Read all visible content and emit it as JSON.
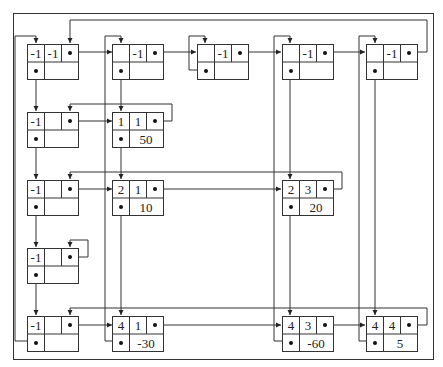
{
  "diagram": {
    "type": "orthogonal-linked-list-sparse-matrix",
    "frame_color": "#333333",
    "column_headers": [
      {
        "id": "h0",
        "row": "-1",
        "col": "-1"
      },
      {
        "id": "c1",
        "row": "",
        "col": "-1"
      },
      {
        "id": "c2",
        "row": "",
        "col": "-1"
      },
      {
        "id": "c3",
        "row": "",
        "col": "-1"
      },
      {
        "id": "c4",
        "row": "",
        "col": "-1"
      }
    ],
    "row_headers": [
      {
        "id": "r1",
        "row": "-1",
        "col": ""
      },
      {
        "id": "r2",
        "row": "-1",
        "col": ""
      },
      {
        "id": "r3",
        "row": "-1",
        "col": ""
      },
      {
        "id": "r4",
        "row": "-1",
        "col": ""
      }
    ],
    "nodes": [
      {
        "id": "n11",
        "row": "1",
        "col": "1",
        "value": "50"
      },
      {
        "id": "n21",
        "row": "2",
        "col": "1",
        "value": "10"
      },
      {
        "id": "n23",
        "row": "2",
        "col": "3",
        "value": "20"
      },
      {
        "id": "n41",
        "row": "4",
        "col": "1",
        "value": "-30"
      },
      {
        "id": "n43",
        "row": "4",
        "col": "3",
        "value": "-60"
      },
      {
        "id": "n44",
        "row": "4",
        "col": "4",
        "value": "5"
      }
    ]
  }
}
